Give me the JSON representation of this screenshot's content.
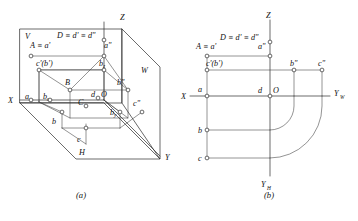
{
  "figure": {
    "captions": {
      "left": "(a)",
      "right": "(b)"
    },
    "ink_color": "#2b2b2b",
    "paper_color": "#ffffff"
  },
  "panel_a": {
    "name": "pictorial-three-plane-view",
    "plane_labels": {
      "v_plane": "V",
      "h_plane": "H",
      "w_plane": "W"
    },
    "axis_labels": {
      "z": "Z",
      "x": "X",
      "y": "Y"
    },
    "origin_label": "O",
    "points": [
      {
        "id": "A-aprime",
        "label": "A ≡ a'",
        "x": 30,
        "y": 48
      },
      {
        "id": "D-dprime-ddbl",
        "label": "D ≡ d' ≡ d\"",
        "x": 57,
        "y": 38
      },
      {
        "id": "a-double",
        "label": "a\"",
        "x": 104,
        "y": 48
      },
      {
        "id": "c-prime-bprime",
        "label": "c'(b')",
        "x": 36,
        "y": 60
      },
      {
        "id": "b-sub-z",
        "label": "b",
        "sub": "z",
        "x": 102,
        "y": 60
      },
      {
        "id": "B",
        "label": "B",
        "x": 67,
        "y": 82
      },
      {
        "id": "b-double",
        "label": "b\"",
        "x": 117,
        "y": 82
      },
      {
        "id": "a-small",
        "label": "a",
        "x": 27,
        "y": 98
      },
      {
        "id": "b-sub-x",
        "label": "b",
        "sub": "x",
        "x": 45,
        "y": 98
      },
      {
        "id": "d-small",
        "label": "d",
        "x": 93,
        "y": 93
      },
      {
        "id": "O",
        "label": "O",
        "x": 102,
        "y": 93
      },
      {
        "id": "C",
        "label": "C",
        "x": 80,
        "y": 100
      },
      {
        "id": "c-double",
        "label": "c\"",
        "x": 131,
        "y": 103
      },
      {
        "id": "b-sub-y",
        "label": "b",
        "sub": "y",
        "x": 112,
        "y": 112
      },
      {
        "id": "b-small",
        "label": "b",
        "x": 54,
        "y": 121
      },
      {
        "id": "c-small",
        "label": "c",
        "x": 78,
        "y": 137
      }
    ]
  },
  "panel_b": {
    "name": "unfolded-orthographic-view",
    "axis_labels": {
      "z": "Z",
      "x": "X",
      "y_w": "Y",
      "y_w_sub": "W",
      "y_h": "Y",
      "y_h_sub": "H"
    },
    "origin_label": "O",
    "points": [
      {
        "id": "A-aprime",
        "label": "A ≡ a'",
        "x": 199,
        "y": 48
      },
      {
        "id": "D-dprime-ddbl",
        "label": "D ≡ d' ≡ d\"",
        "x": 222,
        "y": 37
      },
      {
        "id": "a-double",
        "label": "a\"",
        "x": 258,
        "y": 48
      },
      {
        "id": "c-prime-bprime",
        "label": "c'(b')",
        "x": 205,
        "y": 63
      },
      {
        "id": "b-double",
        "label": "b\"",
        "x": 292,
        "y": 63
      },
      {
        "id": "c-double",
        "label": "c\"",
        "x": 320,
        "y": 63
      },
      {
        "id": "a-small",
        "label": "a",
        "x": 199,
        "y": 90
      },
      {
        "id": "d-small",
        "label": "d",
        "x": 258,
        "y": 90
      },
      {
        "id": "O",
        "label": "O",
        "x": 270,
        "y": 90
      },
      {
        "id": "b-small",
        "label": "b",
        "x": 199,
        "y": 127
      },
      {
        "id": "c-small",
        "label": "c",
        "x": 199,
        "y": 152
      }
    ]
  }
}
